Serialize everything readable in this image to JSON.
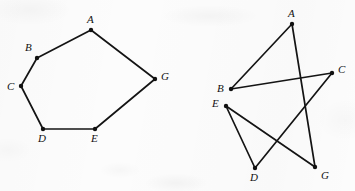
{
  "page": {
    "background_color": "#fcfcfc",
    "ink_color": "#141414",
    "width": 355,
    "height": 191
  },
  "figures": [
    {
      "id": "left-figure",
      "name": "convex-hexagon-graph",
      "description": "Cycle graph drawn as a convex hexagon",
      "vertices": [
        {
          "label": "A",
          "x": 91,
          "y": 30,
          "label_x": 87,
          "label_y": 14
        },
        {
          "label": "B",
          "x": 37,
          "y": 58,
          "label_x": 25,
          "label_y": 42
        },
        {
          "label": "C",
          "x": 21,
          "y": 86,
          "label_x": 7,
          "label_y": 81
        },
        {
          "label": "D",
          "x": 43,
          "y": 129,
          "label_x": 38,
          "label_y": 133
        },
        {
          "label": "E",
          "x": 95,
          "y": 129,
          "label_x": 91,
          "label_y": 133
        },
        {
          "label": "G",
          "x": 155,
          "y": 79,
          "label_x": 161,
          "label_y": 71
        }
      ],
      "edges": [
        {
          "from": "A",
          "to": "B"
        },
        {
          "from": "B",
          "to": "C"
        },
        {
          "from": "C",
          "to": "D"
        },
        {
          "from": "D",
          "to": "E"
        },
        {
          "from": "E",
          "to": "G"
        },
        {
          "from": "G",
          "to": "A"
        }
      ]
    },
    {
      "id": "right-figure",
      "name": "crossed-cycle-graph",
      "description": "Same cycle graph redrawn with crossing edges",
      "vertices": [
        {
          "label": "A",
          "x": 292,
          "y": 24,
          "label_x": 288,
          "label_y": 8
        },
        {
          "label": "B",
          "x": 231,
          "y": 89,
          "label_x": 217,
          "label_y": 83
        },
        {
          "label": "C",
          "x": 332,
          "y": 73,
          "label_x": 338,
          "label_y": 64
        },
        {
          "label": "D",
          "x": 255,
          "y": 168,
          "label_x": 250,
          "label_y": 172
        },
        {
          "label": "E",
          "x": 226,
          "y": 106,
          "label_x": 212,
          "label_y": 98
        },
        {
          "label": "G",
          "x": 315,
          "y": 167,
          "label_x": 321,
          "label_y": 170
        }
      ],
      "edges": [
        {
          "from": "A",
          "to": "B"
        },
        {
          "from": "B",
          "to": "C"
        },
        {
          "from": "C",
          "to": "D"
        },
        {
          "from": "D",
          "to": "E"
        },
        {
          "from": "E",
          "to": "G"
        },
        {
          "from": "G",
          "to": "A"
        }
      ]
    }
  ]
}
